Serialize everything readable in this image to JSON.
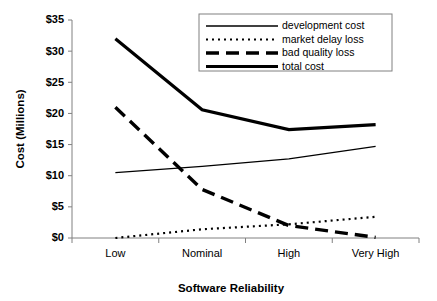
{
  "chart_data": {
    "type": "line",
    "title": "",
    "xlabel": "Software Reliability",
    "ylabel": "Cost (Millions)",
    "categories": [
      "Low",
      "Nominal",
      "High",
      "Very High"
    ],
    "ylim": [
      0,
      35
    ],
    "yticks": [
      0,
      5,
      10,
      15,
      20,
      25,
      30,
      35
    ],
    "ytick_labels": [
      "$0",
      "$5",
      "$10",
      "$15",
      "$20",
      "$25",
      "$30",
      "$35"
    ],
    "grid": false,
    "legend_position": "top-center",
    "series": [
      {
        "name": "development cost",
        "style": "thin-solid",
        "values": [
          10.5,
          11.5,
          12.7,
          14.7
        ]
      },
      {
        "name": "market delay loss",
        "style": "fine-dotted",
        "values": [
          0.0,
          1.4,
          2.2,
          3.4
        ]
      },
      {
        "name": "bad quality loss",
        "style": "thick-dashed",
        "values": [
          21.0,
          7.8,
          2.0,
          0.1
        ]
      },
      {
        "name": "total cost",
        "style": "thick-solid",
        "values": [
          32.0,
          20.6,
          17.4,
          18.2
        ]
      }
    ]
  },
  "axis": {
    "y_label": "Cost (Millions)",
    "x_label": "Software Reliability",
    "y_ticks": [
      "$35",
      "$30",
      "$25",
      "$20",
      "$15",
      "$10",
      "$5",
      "$0"
    ],
    "x_ticks": [
      "Low",
      "Nominal",
      "High",
      "Very High"
    ]
  },
  "legend": {
    "entries": [
      {
        "label": "development cost"
      },
      {
        "label": "market delay loss"
      },
      {
        "label": "bad quality loss"
      },
      {
        "label": "total cost"
      }
    ]
  }
}
